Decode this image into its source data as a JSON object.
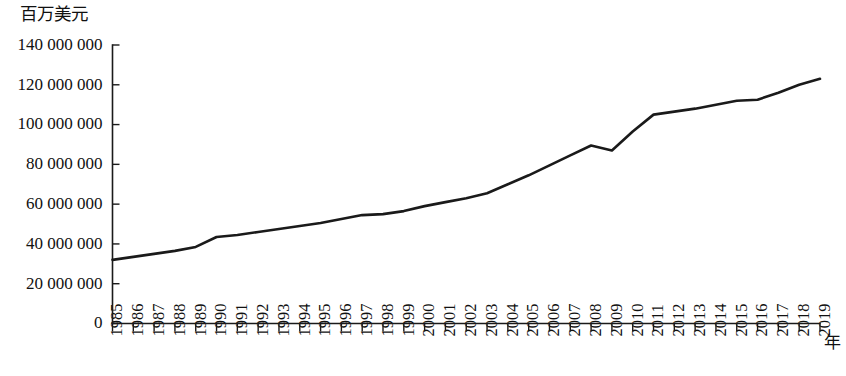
{
  "chart_data": {
    "type": "line",
    "title": "",
    "subtitle": "",
    "ylabel": "百万美元",
    "xlabel": "年",
    "grid": false,
    "legend": null,
    "ylim": [
      0,
      140000000
    ],
    "ytick_values": [
      0,
      20000000,
      40000000,
      60000000,
      80000000,
      100000000,
      120000000,
      140000000
    ],
    "ytick_labels": [
      "0",
      "20 000 000",
      "40 000 000",
      "60 000 000",
      "80 000 000",
      "100 000 000",
      "120 000 000",
      "140 000 000"
    ],
    "xlim": [
      1985,
      2019
    ],
    "categories": [
      "1985",
      "1986",
      "1987",
      "1988",
      "1989",
      "1990",
      "1991",
      "1992",
      "1993",
      "1994",
      "1995",
      "1996",
      "1997",
      "1998",
      "1999",
      "2000",
      "2001",
      "2002",
      "2003",
      "2004",
      "2005",
      "2006",
      "2007",
      "2008",
      "2009",
      "2010",
      "2011",
      "2012",
      "2013",
      "2014",
      "2015",
      "2016",
      "2017",
      "2018",
      "2019"
    ],
    "series": [
      {
        "name": "",
        "values": [
          32000000,
          33500000,
          35000000,
          36500000,
          38500000,
          43500000,
          44500000,
          46000000,
          47500000,
          49000000,
          50500000,
          52500000,
          54500000,
          55000000,
          56500000,
          59000000,
          61000000,
          63000000,
          65500000,
          70000000,
          74500000,
          79500000,
          84500000,
          89500000,
          87000000,
          96500000,
          105000000,
          106500000,
          108000000,
          110000000,
          112000000,
          112500000,
          116000000,
          120000000,
          123000000
        ]
      }
    ]
  }
}
